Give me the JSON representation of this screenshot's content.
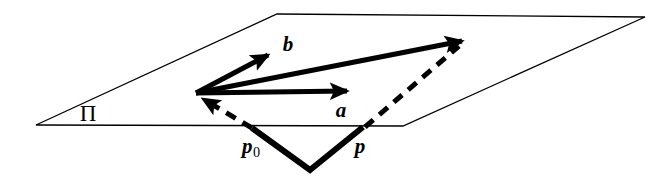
{
  "figure": {
    "width": 655,
    "height": 178,
    "background_color": "#ffffff",
    "ink_color": "#000000",
    "labels": {
      "plane": "Π",
      "vector_a": "a",
      "vector_b": "b",
      "point_p0_base": "p",
      "point_p0_subscript": "0",
      "point_p": "p"
    },
    "geometry": {
      "plane_polygon": [
        [
          36,
          125
        ],
        [
          277,
          14
        ],
        [
          645,
          17
        ],
        [
          403,
          126
        ]
      ],
      "origin_point": [
        196,
        93
      ],
      "vector_a": {
        "from": [
          196,
          93
        ],
        "to": [
          352,
          91
        ]
      },
      "vector_b": {
        "from": [
          196,
          93
        ],
        "to": [
          273,
          52
        ]
      },
      "vector_resultant": {
        "from": [
          196,
          93
        ],
        "to": [
          467,
          38
        ]
      },
      "dashed_p0_to_origin": {
        "from": [
          252,
          128
        ],
        "to": [
          197,
          95
        ]
      },
      "dashed_p_to_tip": {
        "from": [
          365,
          127
        ],
        "to": [
          463,
          43
        ]
      },
      "thick_v_path": [
        [
          252,
          128
        ],
        [
          310,
          170
        ],
        [
          363,
          127
        ]
      ],
      "plane_label_pos": [
        88,
        113
      ],
      "label_a_pos": [
        341,
        110
      ],
      "label_b_pos": [
        288,
        44
      ],
      "label_p0_pos": [
        251,
        148
      ],
      "label_p_pos": [
        360,
        146
      ]
    },
    "style": {
      "plane_stroke_width": 1.3,
      "solid_vector_stroke_width": 5,
      "dashed_vector_stroke_width": 5,
      "dash_pattern": "11 8",
      "thick_v_stroke_width": 6
    }
  }
}
